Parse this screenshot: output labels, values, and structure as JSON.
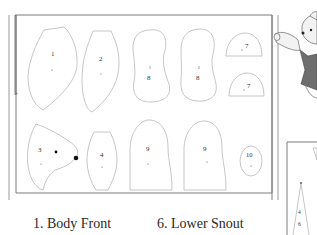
{
  "pieces": [
    {
      "number": "1",
      "name": "Body Front"
    },
    {
      "number": "2",
      "name": ""
    },
    {
      "number": "3",
      "name": ""
    },
    {
      "number": "4",
      "name": ""
    },
    {
      "number": "6",
      "name": "Lower Snout"
    },
    {
      "number": "7",
      "name": ""
    },
    {
      "number": "8",
      "name": ""
    },
    {
      "number": "9",
      "name": ""
    },
    {
      "number": "10",
      "name": ""
    }
  ],
  "labels": {
    "p1": "1",
    "p2": "2",
    "p8a": "8",
    "p8b": "8",
    "p7a": "7",
    "p7b": "7",
    "p3": "3",
    "p4": "4",
    "p9a": "9",
    "p9b": "9",
    "p10": "10",
    "side4": "4",
    "side6": "6"
  },
  "captions": {
    "left": "1. Body Front",
    "right": "6. Lower Snout"
  },
  "colors": {
    "outline": "#b8b8b8",
    "frame": "#7a7a7a",
    "bear_body": "#efefef",
    "vest": "#6e6e6e"
  }
}
